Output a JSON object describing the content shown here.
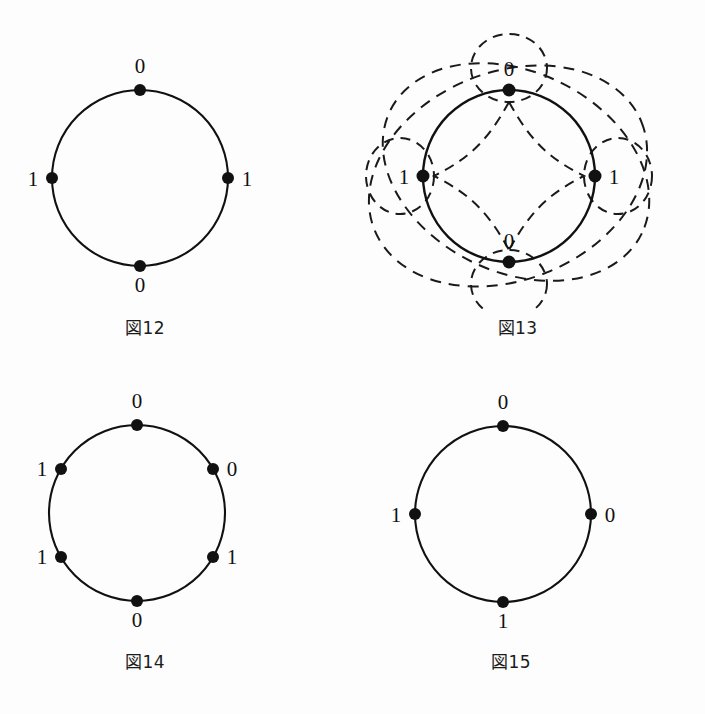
{
  "page": {
    "background_color": "#fdfdfd",
    "ink_color": "#111111",
    "width": 705,
    "height": 714
  },
  "figures": [
    {
      "id": "fig12",
      "caption_kanji": "図",
      "caption_number": "12",
      "caption_full": "図12",
      "type": "labeled-circle",
      "circle": {
        "cx": 140,
        "cy": 178,
        "r": 88
      },
      "nodes": [
        {
          "label": "0",
          "angle_deg": 90,
          "label_pos": "top"
        },
        {
          "label": "1",
          "angle_deg": 180,
          "label_pos": "left"
        },
        {
          "label": "1",
          "angle_deg": 0,
          "label_pos": "right"
        },
        {
          "label": "0",
          "angle_deg": 270,
          "label_pos": "bottom"
        }
      ],
      "dashed_overlay": false
    },
    {
      "id": "fig13",
      "caption_kanji": "図",
      "caption_number": "13",
      "caption_full": "図13",
      "type": "labeled-circle-with-dashed-loops",
      "circle": {
        "cx": 509,
        "cy": 176,
        "r": 86
      },
      "nodes": [
        {
          "label": "0",
          "angle_deg": 90,
          "label_pos": "inside-top"
        },
        {
          "label": "1",
          "angle_deg": 180,
          "label_pos": "inside-left"
        },
        {
          "label": "1",
          "angle_deg": 0,
          "label_pos": "inside-right"
        },
        {
          "label": "0",
          "angle_deg": 270,
          "label_pos": "inside-bottom"
        }
      ],
      "dashed_overlay": true,
      "dashed_small_loops": 4,
      "dashed_large_ellipses": 2
    },
    {
      "id": "fig14",
      "caption_kanji": "図",
      "caption_number": "14",
      "caption_full": "図14",
      "type": "labeled-circle",
      "circle": {
        "cx": 137,
        "cy": 513,
        "r": 88
      },
      "nodes": [
        {
          "label": "0",
          "angle_deg": 90,
          "label_pos": "top"
        },
        {
          "label": "1",
          "angle_deg": 150,
          "label_pos": "upper-left"
        },
        {
          "label": "0",
          "angle_deg": 30,
          "label_pos": "upper-right"
        },
        {
          "label": "1",
          "angle_deg": 210,
          "label_pos": "lower-left"
        },
        {
          "label": "1",
          "angle_deg": 330,
          "label_pos": "lower-right"
        },
        {
          "label": "0",
          "angle_deg": 270,
          "label_pos": "bottom"
        }
      ],
      "dashed_overlay": false
    },
    {
      "id": "fig15",
      "caption_kanji": "図",
      "caption_number": "15",
      "caption_full": "図15",
      "type": "labeled-circle",
      "circle": {
        "cx": 503,
        "cy": 514,
        "r": 88
      },
      "nodes": [
        {
          "label": "0",
          "angle_deg": 90,
          "label_pos": "top"
        },
        {
          "label": "1",
          "angle_deg": 180,
          "label_pos": "left"
        },
        {
          "label": "0",
          "angle_deg": 0,
          "label_pos": "right"
        },
        {
          "label": "1",
          "angle_deg": 270,
          "label_pos": "bottom"
        }
      ],
      "dashed_overlay": false
    }
  ],
  "labels": {
    "fig12": {
      "top": "0",
      "left": "1",
      "right": "1",
      "bottom": "0"
    },
    "fig13": {
      "top": "0",
      "left": "1",
      "right": "1",
      "bottom": "0"
    },
    "fig14": {
      "top": "0",
      "upper_left": "1",
      "upper_right": "0",
      "lower_left": "1",
      "lower_right": "1",
      "bottom": "0"
    },
    "fig15": {
      "top": "0",
      "left": "1",
      "right": "0",
      "bottom": "1"
    }
  },
  "captions": {
    "fig12": "図12",
    "fig13": "図13",
    "fig14": "図14",
    "fig15": "図15"
  }
}
